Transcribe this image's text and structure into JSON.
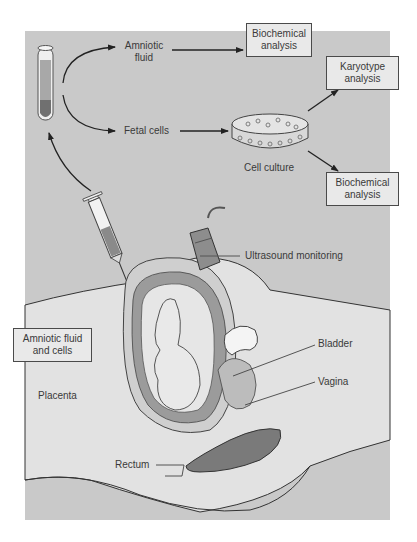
{
  "diagram": {
    "colors": {
      "panel_background": "#c9c9c9",
      "label_box_fill": "#e9e9e9",
      "label_box_border": "#4a4a4a",
      "text": "#3a3a3a",
      "body_fill": "#e2e2e2",
      "dark_tissue": "#7a7a7a"
    },
    "labels": {
      "amniotic_fluid": "Amniotic\nfluid",
      "amniotic_fluid_line1": "Amniotic",
      "amniotic_fluid_line2": "fluid",
      "fetal_cells": "Fetal cells",
      "cell_culture": "Cell culture",
      "ultrasound_monitoring": "Ultrasound monitoring",
      "bladder": "Bladder",
      "vagina": "Vagina",
      "placenta": "Placenta",
      "rectum": "Rectum"
    },
    "boxes": {
      "biochemical_top_line1": "Biochemical",
      "biochemical_top_line2": "analysis",
      "karyotype_line1": "Karyotype",
      "karyotype_line2": "analysis",
      "biochemical_bottom_line1": "Biochemical",
      "biochemical_bottom_line2": "analysis",
      "amniotic_cells_line1": "Amniotic fluid",
      "amniotic_cells_line2": "and cells"
    },
    "flow": [
      {
        "from": "syringe",
        "to": "test-tube"
      },
      {
        "from": "test-tube",
        "to": "Amniotic fluid"
      },
      {
        "from": "test-tube",
        "to": "Fetal cells"
      },
      {
        "from": "Amniotic fluid",
        "to": "Biochemical analysis"
      },
      {
        "from": "Fetal cells",
        "to": "Cell culture"
      },
      {
        "from": "Cell culture",
        "to": "Karyotype analysis"
      },
      {
        "from": "Cell culture",
        "to": "Biochemical analysis"
      }
    ]
  }
}
